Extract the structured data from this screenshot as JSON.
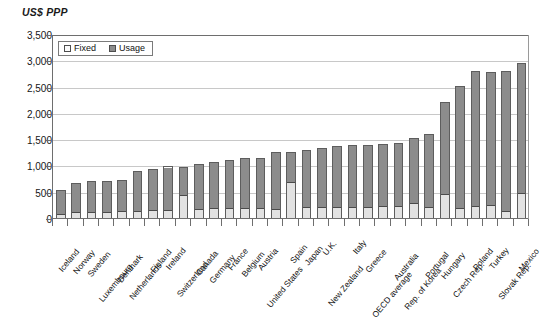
{
  "chart_data": {
    "type": "bar",
    "subtype": "stacked-vertical",
    "title": "",
    "ylabel": "US$ PPP",
    "xlabel": "",
    "ylim": [
      0,
      3500
    ],
    "ytick_step": 500,
    "yticks": [
      "0",
      "500",
      "1,000",
      "1,500",
      "2,000",
      "2,500",
      "3,000",
      "3,500"
    ],
    "ytick_values": [
      0,
      500,
      1000,
      1500,
      2000,
      2500,
      3000,
      3500
    ],
    "grid": "horizontal",
    "legend_position": "top-left-inside",
    "categories": [
      "Iceland",
      "Norway",
      "Sweden",
      "Luxembourg",
      "Denmark",
      "Netherlands",
      "Finland",
      "Ireland",
      "Switzerland",
      "Canada",
      "Germany",
      "France",
      "Belgium",
      "Austria",
      "United States",
      "Spain",
      "Japan",
      "U.K.",
      "New Zealand",
      "Italy",
      "Greece",
      "OECD average",
      "Australia",
      "Rep. of Korea",
      "Portugal",
      "Hungary",
      "Czech Rep.",
      "Poland",
      "Turkey",
      "Slovak Rep.",
      "Mexico"
    ],
    "series": [
      {
        "name": "Fixed",
        "color": "#e2e2e2",
        "values": [
          75,
          110,
          120,
          125,
          130,
          140,
          150,
          150,
          440,
          175,
          190,
          195,
          195,
          200,
          175,
          700,
          205,
          205,
          215,
          210,
          215,
          225,
          230,
          280,
          215,
          455,
          195,
          235,
          250,
          125,
          480
        ]
      },
      {
        "name": "Usage",
        "color": "#8c8c8c",
        "values": [
          465,
          565,
          585,
          575,
          590,
          755,
          790,
          830,
          530,
          845,
          870,
          900,
          940,
          950,
          1080,
          555,
          1095,
          1135,
          1155,
          1185,
          1180,
          1180,
          1190,
          1245,
          1390,
          1760,
          2320,
          2555,
          2520,
          2670,
          2470
        ]
      }
    ],
    "totals": [
      540,
      675,
      705,
      700,
      720,
      895,
      940,
      980,
      970,
      1020,
      1060,
      1095,
      1135,
      1150,
      1255,
      1255,
      1300,
      1340,
      1370,
      1395,
      1395,
      1405,
      1420,
      1525,
      1605,
      2215,
      2515,
      2790,
      2770,
      2795,
      2950
    ],
    "legend": [
      {
        "label": "Fixed",
        "swatch": "light"
      },
      {
        "label": "Usage",
        "swatch": "dark"
      }
    ]
  },
  "colors": {
    "usage": "#8c8c8c",
    "fixed": "#e2e2e2",
    "bar_outline": "#5d5d5d",
    "axis": "#6e6e6e",
    "gridline": "#c8c8c8",
    "text": "#111111",
    "background": "#ffffff"
  }
}
